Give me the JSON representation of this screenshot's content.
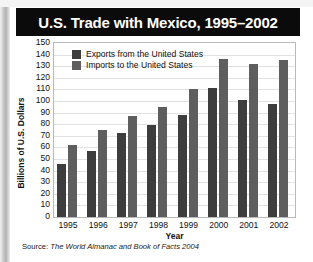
{
  "title": "U.S. Trade with Mexico, 1995–2002",
  "source": {
    "prefix": "Source: ",
    "title": "The World Almanac and Book of Facts 2004"
  },
  "colors": {
    "title_bar_background": "#0b0b0b",
    "title_text": "#ffffff",
    "exports_bar": "#3d3d3d",
    "imports_bar": "#5e5e5e",
    "plot_background": "#ffffff",
    "gridline": "#e2e2e2",
    "plot_border": "#b9b9b9",
    "page_background": "#ffffff"
  },
  "chart_data": {
    "type": "bar",
    "title": "U.S. Trade with Mexico, 1995–2002",
    "xlabel": "Year",
    "ylabel": "Billions of U.S. Dollars",
    "categories": [
      "1995",
      "1996",
      "1997",
      "1998",
      "1999",
      "2000",
      "2001",
      "2002"
    ],
    "series": [
      {
        "name": "Exports from the United States",
        "color": "#3d3d3d",
        "values": [
          46,
          57,
          72,
          79,
          88,
          111,
          101,
          97
        ]
      },
      {
        "name": "Imports to the United States",
        "color": "#5e5e5e",
        "values": [
          62,
          75,
          87,
          95,
          110,
          136,
          132,
          135
        ]
      }
    ],
    "ylim": [
      0,
      150
    ],
    "ytick_step": 10,
    "yticks": [
      150,
      140,
      130,
      120,
      110,
      100,
      90,
      80,
      70,
      60,
      50,
      40,
      30,
      20,
      10,
      0
    ],
    "grid": true,
    "legend_position": "top-left-inside"
  }
}
